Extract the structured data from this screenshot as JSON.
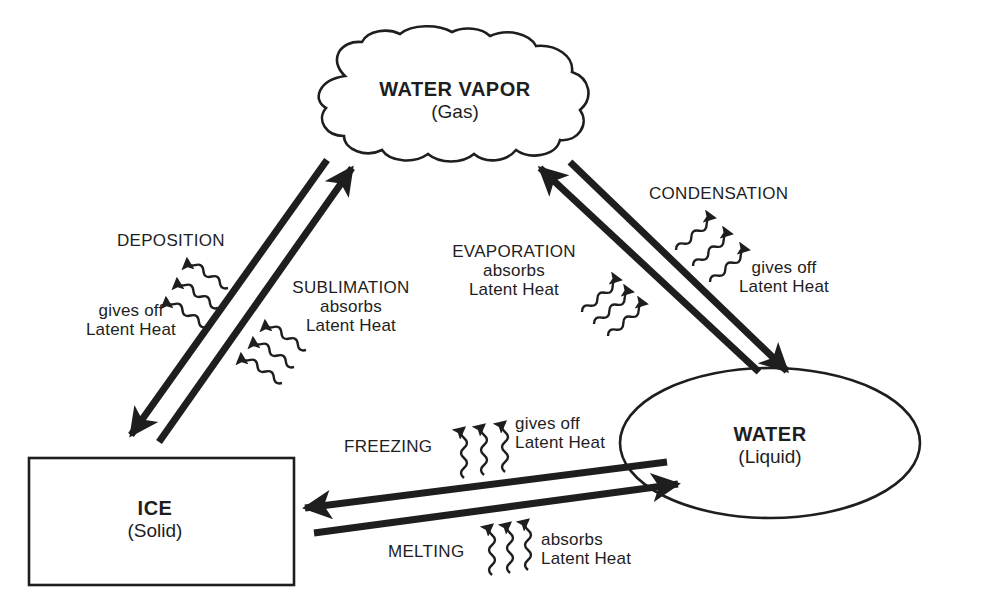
{
  "diagram": {
    "type": "water phase change cycle",
    "colors": {
      "ink": "#1e1e1e",
      "background": "#ffffff"
    },
    "nodes": {
      "vapor": {
        "name": "WATER VAPOR",
        "state": "(Gas)",
        "shape": "cloud"
      },
      "water": {
        "name": "WATER",
        "state": "(Liquid)",
        "shape": "ellipse"
      },
      "ice": {
        "name": "ICE",
        "state": "(Solid)",
        "shape": "rectangle"
      }
    },
    "processes": {
      "deposition": {
        "label": "DEPOSITION",
        "heat_line1": "gives off",
        "heat_line2": "Latent Heat",
        "from": "WATER VAPOR",
        "to": "ICE"
      },
      "sublimation": {
        "label": "SUBLIMATION",
        "heat_line1": "absorbs",
        "heat_line2": "Latent Heat",
        "from": "ICE",
        "to": "WATER VAPOR"
      },
      "evaporation": {
        "label": "EVAPORATION",
        "heat_line1": "absorbs",
        "heat_line2": "Latent Heat",
        "from": "WATER",
        "to": "WATER VAPOR"
      },
      "condensation": {
        "label": "CONDENSATION",
        "heat_line1": "gives off",
        "heat_line2": "Latent Heat",
        "from": "WATER VAPOR",
        "to": "WATER"
      },
      "freezing": {
        "label": "FREEZING",
        "heat_line1": "gives off",
        "heat_line2": "Latent Heat",
        "from": "WATER",
        "to": "ICE"
      },
      "melting": {
        "label": "MELTING",
        "heat_line1": "absorbs",
        "heat_line2": "Latent Heat",
        "from": "ICE",
        "to": "WATER"
      }
    }
  }
}
